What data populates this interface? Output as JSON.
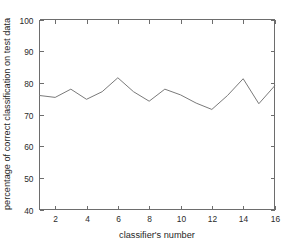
{
  "chart_data": {
    "type": "line",
    "title": "",
    "xlabel": "classifier's number",
    "ylabel": "percentage of correct classification on test data",
    "x": [
      1,
      2,
      3,
      4,
      5,
      6,
      7,
      8,
      9,
      10,
      11,
      12,
      13,
      14,
      15,
      16
    ],
    "values": [
      76.0,
      75.4,
      78.0,
      74.8,
      77.2,
      81.6,
      77.2,
      74.2,
      78.0,
      76.2,
      73.6,
      71.6,
      76.0,
      81.3,
      73.4,
      79.0
    ],
    "series": [
      {
        "name": "percentage of correct classification on test data",
        "values": [
          76.0,
          75.4,
          78.0,
          74.8,
          77.2,
          81.6,
          77.2,
          74.2,
          78.0,
          76.2,
          73.6,
          71.6,
          76.0,
          81.3,
          73.4,
          79.0
        ]
      }
    ],
    "xlim": [
      1,
      16
    ],
    "ylim": [
      40,
      100
    ],
    "xticks": [
      2,
      4,
      6,
      8,
      10,
      12,
      14,
      16
    ],
    "xticklabels": [
      "2",
      "4",
      "6",
      "8",
      "10",
      "12",
      "14",
      "16"
    ],
    "yticks": [
      40,
      50,
      60,
      70,
      80,
      90,
      100
    ],
    "yticklabels": [
      "40",
      "50",
      "60",
      "70",
      "80",
      "90",
      "100"
    ],
    "grid": false,
    "legend": false,
    "line_color": "#7a7a7a",
    "axis_color": "#6d6d6d",
    "background_color": "#ffffff"
  },
  "axes": {
    "x_title": "classifier's number",
    "y_title": "percentage of correct classification on test data",
    "x_tick_labels": [
      "2",
      "4",
      "6",
      "8",
      "10",
      "12",
      "14",
      "16"
    ],
    "y_tick_labels": [
      "100",
      "90",
      "80",
      "70",
      "60",
      "50",
      "40"
    ]
  }
}
